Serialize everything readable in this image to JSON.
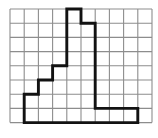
{
  "figure": {
    "background_color": "#ffffff"
  },
  "grid": {
    "origin_x": 10,
    "origin_y": 9,
    "cell_size": 14.2,
    "columns": 10,
    "rows": 8,
    "line_color": "#8d8d8d",
    "line_width": 1.1,
    "outer_border": true
  },
  "shape": {
    "name": "staircase-tower-polygon",
    "stroke_color": "#121212",
    "stroke_width": 2.9,
    "fill": "none",
    "closed": true,
    "vertices_grid": [
      [
        1,
        6
      ],
      [
        2,
        6
      ],
      [
        2,
        5
      ],
      [
        3,
        5
      ],
      [
        3,
        4
      ],
      [
        4,
        4
      ],
      [
        4,
        0
      ],
      [
        5,
        0
      ],
      [
        5,
        1
      ],
      [
        6,
        1
      ],
      [
        6,
        7
      ],
      [
        9,
        7
      ],
      [
        9,
        8
      ],
      [
        1,
        8
      ]
    ]
  }
}
